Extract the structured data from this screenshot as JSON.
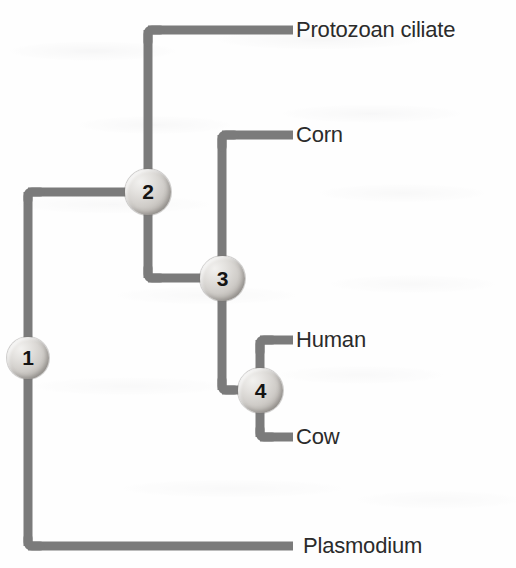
{
  "figure": {
    "type": "phylogenetic-tree",
    "orientation": "left-to-right",
    "line_color": "#7b7b7b",
    "line_width": 9,
    "text_color": "#2b2b2b",
    "background_color": "#fefefe"
  },
  "taxa": [
    {
      "id": "protozoan-ciliate",
      "label": "Protozoan ciliate",
      "tip_y": 30,
      "tip_x": 293
    },
    {
      "id": "corn",
      "label": "Corn",
      "tip_y": 135,
      "tip_x": 293
    },
    {
      "id": "human",
      "label": "Human",
      "tip_y": 340,
      "tip_x": 293
    },
    {
      "id": "cow",
      "label": "Cow",
      "tip_y": 437,
      "tip_x": 293
    },
    {
      "id": "plasmodium",
      "label": "Plasmodium",
      "tip_y": 546,
      "tip_x": 293
    }
  ],
  "nodes": [
    {
      "id": "node-1",
      "number": "1",
      "x": 28,
      "y": 358,
      "children": [
        "node-2",
        "plasmodium"
      ]
    },
    {
      "id": "node-2",
      "number": "2",
      "x": 148,
      "y": 192,
      "children": [
        "protozoan-ciliate",
        "node-3"
      ]
    },
    {
      "id": "node-3",
      "number": "3",
      "x": 222,
      "y": 278,
      "children": [
        "corn",
        "node-4"
      ]
    },
    {
      "id": "node-4",
      "number": "4",
      "x": 260,
      "y": 390,
      "children": [
        "human",
        "cow"
      ]
    }
  ],
  "labels": {
    "protozoan_ciliate": "Protozoan ciliate",
    "corn": "Corn",
    "human": "Human",
    "cow": "Cow",
    "plasmodium": "Plasmodium"
  },
  "node_numbers": {
    "one": "1",
    "two": "2",
    "three": "3",
    "four": "4"
  }
}
